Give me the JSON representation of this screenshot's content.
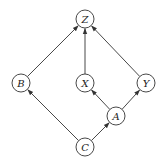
{
  "diagram": {
    "type": "directed-acyclic-graph",
    "colors": {
      "stroke": "#333333",
      "fill": "#ffffff",
      "text": "#222222"
    },
    "node_radius": 9,
    "nodes": [
      {
        "id": "Z",
        "label": "Z",
        "x": 85,
        "y": 19
      },
      {
        "id": "B",
        "label": "B",
        "x": 21,
        "y": 83
      },
      {
        "id": "X",
        "label": "X",
        "x": 85,
        "y": 83
      },
      {
        "id": "Y",
        "label": "Y",
        "x": 146,
        "y": 83
      },
      {
        "id": "A",
        "label": "A",
        "x": 116,
        "y": 116
      },
      {
        "id": "C",
        "label": "C",
        "x": 85,
        "y": 147
      }
    ],
    "edges": [
      {
        "from": "B",
        "to": "Z"
      },
      {
        "from": "X",
        "to": "Z"
      },
      {
        "from": "Y",
        "to": "Z"
      },
      {
        "from": "C",
        "to": "B"
      },
      {
        "from": "C",
        "to": "A"
      },
      {
        "from": "A",
        "to": "X"
      },
      {
        "from": "A",
        "to": "Y"
      }
    ]
  }
}
